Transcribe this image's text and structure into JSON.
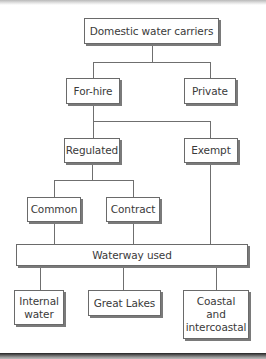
{
  "diagram": {
    "type": "hierarchy",
    "root": {
      "label": "Domestic water carriers"
    },
    "level1": [
      {
        "label": "For-hire"
      },
      {
        "label": "Private"
      }
    ],
    "level2": [
      {
        "label": "Regulated"
      },
      {
        "label": "Exempt"
      }
    ],
    "level3": [
      {
        "label": "Common"
      },
      {
        "label": "Contract"
      }
    ],
    "merge": {
      "label": "Waterway used"
    },
    "level4": [
      {
        "label": "Internal\nwater"
      },
      {
        "label": "Great Lakes"
      },
      {
        "label": "Coastal\nand\nintercoastal"
      }
    ],
    "edges": [
      [
        "Domestic water carriers",
        "For-hire"
      ],
      [
        "Domestic water carriers",
        "Private"
      ],
      [
        "For-hire",
        "Regulated"
      ],
      [
        "For-hire",
        "Exempt"
      ],
      [
        "Regulated",
        "Common"
      ],
      [
        "Regulated",
        "Contract"
      ],
      [
        "Common",
        "Waterway used"
      ],
      [
        "Contract",
        "Waterway used"
      ],
      [
        "Exempt",
        "Waterway used"
      ],
      [
        "Waterway used",
        "Internal water"
      ],
      [
        "Waterway used",
        "Great Lakes"
      ],
      [
        "Waterway used",
        "Coastal and intercoastal"
      ]
    ]
  },
  "colors": {
    "line": "#6f6f6f",
    "box_border": "#6a6a6a",
    "box_shadow": "#7a7a7a",
    "text": "#3a3a3a",
    "background": "#ffffff"
  }
}
